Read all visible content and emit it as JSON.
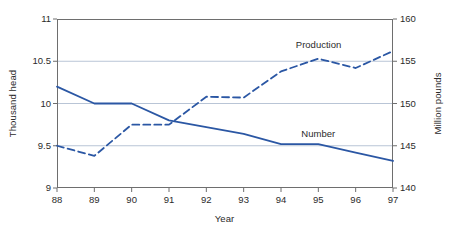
{
  "chart_data": {
    "type": "line",
    "title": "",
    "xlabel": "Year",
    "ylabel": "Thousand head",
    "ylabel_right": "Million pounds",
    "x": [
      "88",
      "89",
      "90",
      "91",
      "92",
      "93",
      "94",
      "95",
      "96",
      "97"
    ],
    "ylim": [
      9,
      11
    ],
    "ylim_right": [
      140,
      160
    ],
    "yticks": [
      "9",
      "9.5",
      "10",
      "10.5",
      "11"
    ],
    "yticks_right": [
      "140",
      "145",
      "150",
      "155",
      "160"
    ],
    "grid": true,
    "legend_position": "inline-annotation",
    "series": [
      {
        "name": "Number",
        "axis": "left",
        "style": "solid",
        "color": "#2b57a4",
        "values": [
          10.2,
          10.0,
          10.0,
          9.8,
          9.72,
          9.64,
          9.52,
          9.52,
          9.42,
          9.32
        ]
      },
      {
        "name": "Production",
        "axis": "right",
        "style": "dashed",
        "color": "#2b57a4",
        "values": [
          145.0,
          143.8,
          147.5,
          147.5,
          150.8,
          150.7,
          153.8,
          155.3,
          154.2,
          156.2
        ]
      }
    ],
    "annotations": [
      {
        "text": "Production",
        "x": "95",
        "y": 156.8
      },
      {
        "text": "Number",
        "x": "95",
        "y": 9.63
      }
    ]
  },
  "colors": {
    "line": "#2b57a4",
    "grid": "#b9c5d6",
    "frame": "#6e6e6e",
    "text": "#2b2b2b"
  },
  "axes": {
    "left_title": "Thousand head",
    "right_title": "Million pounds",
    "x_title": "Year"
  },
  "labels": {
    "production": "Production",
    "number": "Number"
  }
}
